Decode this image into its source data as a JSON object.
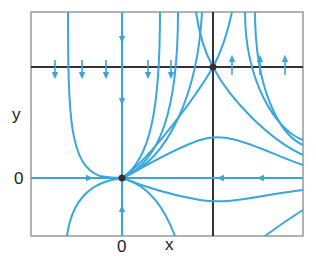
{
  "diagram": {
    "type": "phase-portrait",
    "axis_labels": {
      "x": "x",
      "y": "y"
    },
    "tick_labels": {
      "x_zero": "0",
      "y_zero": "0"
    },
    "equilibria": [
      {
        "name": "origin",
        "x": 0,
        "y": 0,
        "kind": "node"
      },
      {
        "name": "saddle",
        "x": 1,
        "y": 1,
        "kind": "saddle"
      }
    ],
    "colors": {
      "trajectory": "#3aa6dc",
      "axis": "#333333",
      "frame": "#777777",
      "point": "#333333"
    }
  }
}
